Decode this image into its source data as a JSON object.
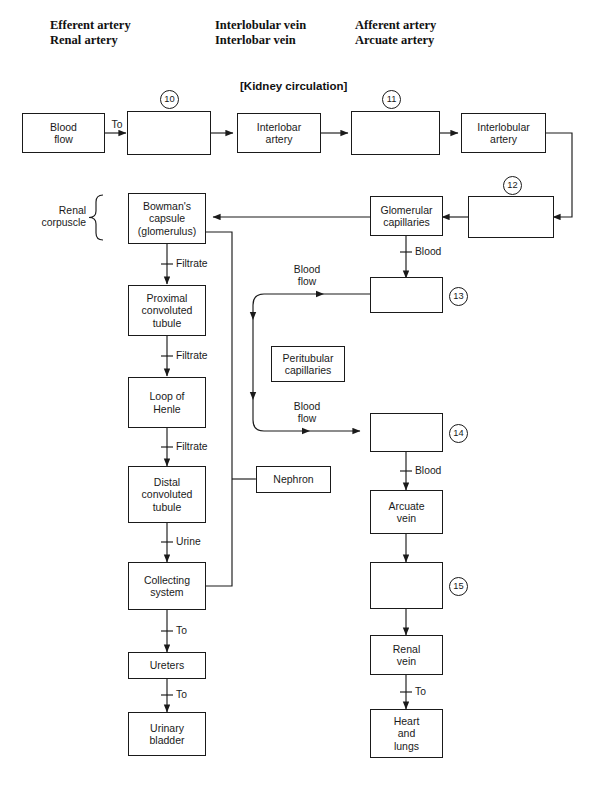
{
  "header_columns": [
    {
      "line1": "Efferent artery",
      "line2": "Renal artery"
    },
    {
      "line1": "Interlobular vein",
      "line2": "Interlobar vein"
    },
    {
      "line1": "Afferent artery",
      "line2": "Arcuate artery"
    }
  ],
  "title": "[Kidney circulation]",
  "nodes": {
    "blood_flow": "Blood\nflow",
    "box10": "",
    "interlobar_artery": "Interlobar\nartery",
    "box11": "",
    "interlobular_artery": "Interlobular\nartery",
    "bowmans_capsule": "Bowman's\ncapsule\n(glomerulus)",
    "glomerular_capillaries": "Glomerular\ncapillaries",
    "box12": "",
    "box13": "",
    "proximal_convoluted_tubule": "Proximal\nconvoluted\ntubule",
    "peritubular_capillaries": "Peritubular\ncapillaries",
    "loop_of_henle": "Loop of\nHenle",
    "box14": "",
    "distal_convoluted_tubule": "Distal\nconvoluted\ntubule",
    "nephron": "Nephron",
    "arcuate_vein": "Arcuate\nvein",
    "collecting_system": "Collecting\nsystem",
    "box15": "",
    "ureters": "Ureters",
    "renal_vein": "Renal\nvein",
    "urinary_bladder": "Urinary\nbladder",
    "heart_and_lungs": "Heart\nand\nlungs"
  },
  "edge_labels": {
    "to_box10": "To",
    "filtrate_1": "Filtrate",
    "blood_glom": "Blood",
    "blood_flow_upper": "Blood\nflow",
    "filtrate_2": "Filtrate",
    "blood_flow_lower": "Blood\nflow",
    "filtrate_3": "Filtrate",
    "blood_box14": "Blood",
    "urine": "Urine",
    "to_ureters": "To",
    "to_bladder": "To",
    "to_heart": "To"
  },
  "callouts": [
    "10",
    "11",
    "12",
    "13",
    "14",
    "15"
  ],
  "brace_label": "Renal\ncorpuscle",
  "colors": {
    "line": "#1a1a1a",
    "text": "#1a1a1a",
    "background": "#ffffff"
  }
}
